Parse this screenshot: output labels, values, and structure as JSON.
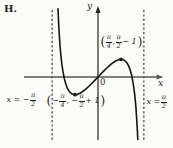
{
  "figure": {
    "heading": "H.",
    "axis": {
      "x_label": "x",
      "y_label": "y",
      "origin_label": "0"
    },
    "colors": {
      "ink": "#1d1d1d",
      "x_axis": "#555555",
      "y_axis": "#222222",
      "curve": "#141414",
      "dash": "#2b2b2b",
      "background": "#fbfbf8"
    },
    "labels": {
      "max_point": [
        {
          "p": "("
        },
        {
          "f": [
            "π",
            "4"
          ]
        },
        {
          "t": ", "
        },
        {
          "f": [
            "π",
            "2"
          ]
        },
        {
          "t": " − 1"
        },
        {
          "p": ")"
        }
      ],
      "min_point": [
        {
          "p": "("
        },
        {
          "t": "− "
        },
        {
          "f": [
            "π",
            "4"
          ]
        },
        {
          "t": ", − "
        },
        {
          "f": [
            "π",
            "2"
          ]
        },
        {
          "t": " + 1"
        },
        {
          "p": ")"
        }
      ],
      "left_asymptote": [
        {
          "t": "x = − "
        },
        {
          "f": [
            "π",
            "2"
          ]
        }
      ],
      "right_asymptote": [
        {
          "t": "x = "
        },
        {
          "f": [
            "π",
            "2"
          ]
        }
      ]
    }
  },
  "chart_data": {
    "type": "line",
    "title": "",
    "xlabel": "x",
    "ylabel": "y",
    "xlim": [
      -1.5708,
      1.5708
    ],
    "ylim": [
      -2.2,
      2.3
    ],
    "grid": false,
    "x_asymptotes": [
      -1.5708,
      1.5708
    ],
    "asymptote_labels": [
      "x = −π/2",
      "x = π/2"
    ],
    "marked_points": [
      {
        "x": -0.7854,
        "y": -0.5708,
        "label": "(−π/4, −π/2+1)"
      },
      {
        "x": 0.7854,
        "y": 0.5708,
        "label": "(π/4, π/2−1)"
      }
    ],
    "series": [
      {
        "name": "curve",
        "points": [
          [
            -1.371,
            2.201
          ],
          [
            -1.36,
            1.953
          ],
          [
            -1.34,
            1.575
          ],
          [
            -1.32,
            1.263
          ],
          [
            -1.3,
            1.002
          ],
          [
            -1.27,
            0.684
          ],
          [
            -1.24,
            0.432
          ],
          [
            -1.2,
            0.172
          ],
          [
            -1.15,
            -0.066
          ],
          [
            -1.1,
            -0.235
          ],
          [
            -1.05,
            -0.357
          ],
          [
            -1.0,
            -0.443
          ],
          [
            -0.95,
            -0.502
          ],
          [
            -0.9,
            -0.54
          ],
          [
            -0.85,
            -0.562
          ],
          [
            -0.785,
            -0.571
          ],
          [
            -0.72,
            -0.563
          ],
          [
            -0.6,
            -0.516
          ],
          [
            -0.45,
            -0.417
          ],
          [
            -0.3,
            -0.291
          ],
          [
            -0.15,
            -0.149
          ],
          [
            0,
            0
          ],
          [
            0.15,
            0.149
          ],
          [
            0.3,
            0.291
          ],
          [
            0.45,
            0.417
          ],
          [
            0.6,
            0.516
          ],
          [
            0.72,
            0.563
          ],
          [
            0.785,
            0.571
          ],
          [
            0.85,
            0.562
          ],
          [
            0.9,
            0.54
          ],
          [
            0.95,
            0.502
          ],
          [
            1.0,
            0.443
          ],
          [
            1.05,
            0.357
          ],
          [
            1.1,
            0.235
          ],
          [
            1.15,
            0.066
          ],
          [
            1.2,
            -0.172
          ],
          [
            1.24,
            -0.432
          ],
          [
            1.27,
            -0.684
          ],
          [
            1.3,
            -1.002
          ],
          [
            1.32,
            -1.263
          ],
          [
            1.34,
            -1.575
          ],
          [
            1.36,
            -1.953
          ],
          [
            1.363,
            -2.017
          ]
        ]
      }
    ],
    "mapping": {
      "origin_px": [
        98,
        77
      ],
      "px_per_unit": [
        29.2,
        31
      ]
    },
    "axes_px": {
      "x": [
        24,
        158
      ],
      "y": [
        12,
        140
      ]
    },
    "dash_y_px": [
      10,
      140
    ]
  }
}
